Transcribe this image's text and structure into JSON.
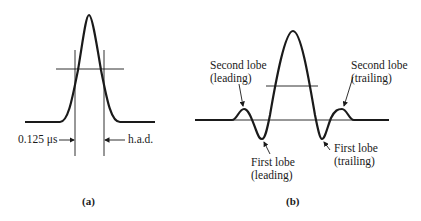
{
  "figure_a": {
    "caption": "(a)",
    "labels": {
      "width_left": "0.125 μs",
      "width_right": "h.a.d."
    }
  },
  "figure_b": {
    "caption": "(b)",
    "labels": {
      "second_lobe_leading": [
        "Second lobe",
        "(leading)"
      ],
      "second_lobe_trailing": [
        "Second lobe",
        "(trailing)"
      ],
      "first_lobe_leading": [
        "First lobe",
        "(leading)"
      ],
      "first_lobe_trailing": [
        "First lobe",
        "(trailing)"
      ]
    }
  },
  "colors": {
    "ink": "#1a1a1a",
    "background": "#ffffff"
  }
}
